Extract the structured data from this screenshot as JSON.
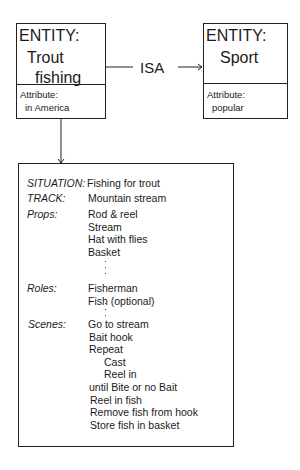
{
  "entity_trout": {
    "header": "ENTITY:",
    "name_line1": "Trout",
    "name_line2": "fishing",
    "attr_label": "Attribute:",
    "attr_value": "in America"
  },
  "relation": {
    "label": "ISA"
  },
  "entity_sport": {
    "header": "ENTITY:",
    "name": "Sport",
    "attr_label": "Attribute:",
    "attr_value": "popular"
  },
  "script": {
    "situation": {
      "label": "SITUATION:",
      "value": "Fishing for trout"
    },
    "track": {
      "label": "TRACK:",
      "value": "Mountain stream"
    },
    "props": {
      "label": "Props:",
      "items": [
        "Rod & reel",
        "Stream",
        "Hat with flies",
        "Basket"
      ]
    },
    "roles": {
      "label": "Roles:",
      "items": [
        "Fisherman",
        "Fish (optional)"
      ]
    },
    "scenes": {
      "label": "Scenes:",
      "items": [
        "Go to stream",
        "Bait hook",
        "Repeat",
        "Cast",
        "Reel in",
        "until Bite or no Bait",
        "Reel in fish",
        "Remove fish from hook",
        "Store fish in basket"
      ]
    }
  }
}
